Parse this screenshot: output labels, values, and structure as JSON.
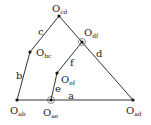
{
  "diagram": {
    "nodes": [
      {
        "id": "cd",
        "label": "O",
        "sub": "cd",
        "x": 59,
        "y": 16,
        "lx": 52,
        "ly": 12,
        "circled": false
      },
      {
        "id": "df",
        "label": "O",
        "sub": "df",
        "x": 82,
        "y": 42,
        "lx": 84,
        "ly": 36,
        "circled": true
      },
      {
        "id": "bc",
        "label": "O",
        "sub": "bc",
        "x": 30,
        "y": 52,
        "lx": 36,
        "ly": 56,
        "circled": false
      },
      {
        "id": "ef",
        "label": "O",
        "sub": "ef",
        "x": 57,
        "y": 73,
        "lx": 61,
        "ly": 83,
        "circled": false
      },
      {
        "id": "ab",
        "label": "O",
        "sub": "ab",
        "x": 17,
        "y": 100,
        "lx": 10,
        "ly": 114,
        "circled": false
      },
      {
        "id": "ae",
        "label": "O",
        "sub": "ae",
        "x": 51,
        "y": 100,
        "lx": 43,
        "ly": 116,
        "circled": true
      },
      {
        "id": "ad",
        "label": "O",
        "sub": "ad",
        "x": 133,
        "y": 100,
        "lx": 126,
        "ly": 114,
        "circled": false
      }
    ],
    "edges": [
      {
        "from": "ab",
        "to": "bc",
        "label": "b",
        "lx": 16,
        "ly": 79
      },
      {
        "from": "bc",
        "to": "cd",
        "label": "c",
        "lx": 38,
        "ly": 35
      },
      {
        "from": "cd",
        "to": "ad",
        "label": "d",
        "lx": 96,
        "ly": 57
      },
      {
        "from": "df",
        "to": "ef",
        "label": "f",
        "lx": 70,
        "ly": 66
      },
      {
        "from": "ef",
        "to": "ae",
        "label": "e",
        "lx": 55,
        "ly": 92
      },
      {
        "from": "ab",
        "to": "ad",
        "label": "a",
        "lx": 68,
        "ly": 99
      }
    ]
  }
}
